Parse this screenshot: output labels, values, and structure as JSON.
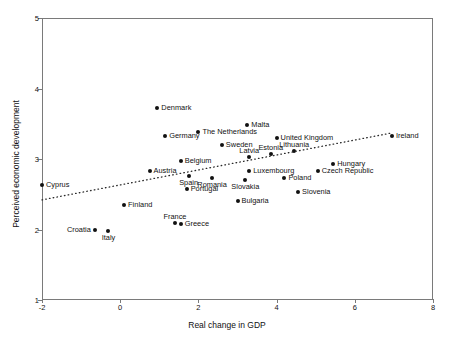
{
  "chart_data": {
    "type": "scatter",
    "title": "",
    "xlabel": "Real change in GDP",
    "ylabel": "Perceived economic development",
    "xlim": [
      -2,
      8
    ],
    "ylim": [
      1,
      5
    ],
    "xticks": [
      -2,
      0,
      2,
      4,
      6,
      8
    ],
    "yticks": [
      1,
      2,
      3,
      4,
      5
    ],
    "xtick_labels": [
      "-2",
      "0",
      "2",
      "4",
      "6",
      "8"
    ],
    "ytick_labels": [
      "1",
      "2",
      "3",
      "4",
      "5"
    ],
    "grid": false,
    "legend": null,
    "trendline": {
      "type": "dotted-linear",
      "x_start": -2.0,
      "y_start": 2.42,
      "x_end": 6.95,
      "y_end": 3.37
    },
    "points": [
      {
        "label": "Denmark",
        "x": 0.95,
        "y": 3.72,
        "label_pos": "right"
      },
      {
        "label": "Malta",
        "x": 3.25,
        "y": 3.48,
        "label_pos": "right"
      },
      {
        "label": "The Netherlands",
        "x": 2.0,
        "y": 3.38,
        "label_pos": "right"
      },
      {
        "label": "Germany",
        "x": 1.15,
        "y": 3.33,
        "label_pos": "right"
      },
      {
        "label": "United Kingdom",
        "x": 4.0,
        "y": 3.3,
        "label_pos": "right"
      },
      {
        "label": "Sweden",
        "x": 2.6,
        "y": 3.2,
        "label_pos": "right"
      },
      {
        "label": "Lithuania",
        "x": 4.45,
        "y": 3.12,
        "label_pos": "above"
      },
      {
        "label": "Estonia",
        "x": 3.85,
        "y": 3.07,
        "label_pos": "above"
      },
      {
        "label": "Latvia",
        "x": 3.3,
        "y": 3.03,
        "label_pos": "above"
      },
      {
        "label": "Belgium",
        "x": 1.55,
        "y": 2.97,
        "label_pos": "right"
      },
      {
        "label": "Hungary",
        "x": 5.45,
        "y": 2.93,
        "label_pos": "right"
      },
      {
        "label": "Austria",
        "x": 0.75,
        "y": 2.83,
        "label_pos": "right"
      },
      {
        "label": "Luxembourg",
        "x": 3.3,
        "y": 2.83,
        "label_pos": "right"
      },
      {
        "label": "Czech Republic",
        "x": 5.05,
        "y": 2.83,
        "label_pos": "right"
      },
      {
        "label": "Spain",
        "x": 1.75,
        "y": 2.76,
        "label_pos": "below"
      },
      {
        "label": "Romania",
        "x": 2.35,
        "y": 2.73,
        "label_pos": "below"
      },
      {
        "label": "Slovakia",
        "x": 3.2,
        "y": 2.7,
        "label_pos": "below"
      },
      {
        "label": "Poland",
        "x": 4.2,
        "y": 2.73,
        "label_pos": "right"
      },
      {
        "label": "Portugal",
        "x": 1.7,
        "y": 2.57,
        "label_pos": "right"
      },
      {
        "label": "Slovenia",
        "x": 4.55,
        "y": 2.53,
        "label_pos": "right"
      },
      {
        "label": "Cyprus",
        "x": -2.0,
        "y": 2.63,
        "label_pos": "right"
      },
      {
        "label": "Bulgaria",
        "x": 3.0,
        "y": 2.4,
        "label_pos": "right"
      },
      {
        "label": "Finland",
        "x": 0.1,
        "y": 2.35,
        "label_pos": "right"
      },
      {
        "label": "France",
        "x": 1.4,
        "y": 2.09,
        "label_pos": "above"
      },
      {
        "label": "Greece",
        "x": 1.55,
        "y": 2.08,
        "label_pos": "right"
      },
      {
        "label": "Croatia",
        "x": -0.65,
        "y": 2.0,
        "label_pos": "left"
      },
      {
        "label": "Italy",
        "x": -0.3,
        "y": 1.98,
        "label_pos": "below"
      },
      {
        "label": "Ireland",
        "x": 6.95,
        "y": 3.32,
        "label_pos": "right"
      }
    ]
  }
}
